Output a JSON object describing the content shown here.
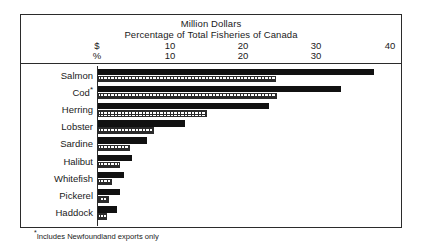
{
  "header": {
    "title_line1": "Million Dollars",
    "title_line2": "Percentage of Total Fisheries of Canada",
    "dollars_symbol": "$",
    "percent_symbol": "%",
    "dollars_ticks": [
      "10",
      "20",
      "30",
      "40"
    ],
    "percent_ticks": [
      "10",
      "20",
      "30"
    ]
  },
  "footnote": {
    "marker": "*",
    "text": "Includes Newfoundland exports only"
  },
  "categories": [
    {
      "label": "Salmon",
      "footnote_marker": ""
    },
    {
      "label": "Cod",
      "footnote_marker": "*"
    },
    {
      "label": "Herring",
      "footnote_marker": ""
    },
    {
      "label": "Lobster",
      "footnote_marker": ""
    },
    {
      "label": "Sardine",
      "footnote_marker": ""
    },
    {
      "label": "Halibut",
      "footnote_marker": ""
    },
    {
      "label": "Whitefish",
      "footnote_marker": ""
    },
    {
      "label": "Pickerel",
      "footnote_marker": ""
    },
    {
      "label": "Haddock",
      "footnote_marker": ""
    }
  ],
  "chart_data": {
    "type": "bar",
    "orientation": "horizontal",
    "xlabel": "",
    "ylabel": "",
    "grid": false,
    "legend": "none",
    "categories": [
      "Salmon",
      "Cod",
      "Herring",
      "Lobster",
      "Sardine",
      "Halibut",
      "Whitefish",
      "Pickerel",
      "Haddock"
    ],
    "series": [
      {
        "name": "Million Dollars",
        "symbol": "$",
        "fill": "solid-black",
        "axis_ticks": [
          10,
          20,
          30,
          40
        ],
        "xlim": [
          0,
          40
        ],
        "values": [
          37.5,
          33.0,
          23.2,
          11.8,
          6.7,
          4.6,
          3.5,
          3.0,
          2.6
        ]
      },
      {
        "name": "Percentage of Total Fisheries of Canada",
        "symbol": "%",
        "fill": "cross-hatch",
        "axis_ticks": [
          10,
          20,
          30
        ],
        "xlim": [
          0,
          40
        ],
        "values": [
          24.2,
          24.3,
          14.8,
          7.6,
          4.4,
          3.0,
          1.9,
          1.5,
          1.2
        ]
      }
    ],
    "annotations": [
      "*Includes Newfoundland exports only"
    ],
    "colors": {
      "dollars": "#111111",
      "percent_outline": "#2b2b2b",
      "background": "#ffffff",
      "frame": "#2b2b2b"
    }
  }
}
